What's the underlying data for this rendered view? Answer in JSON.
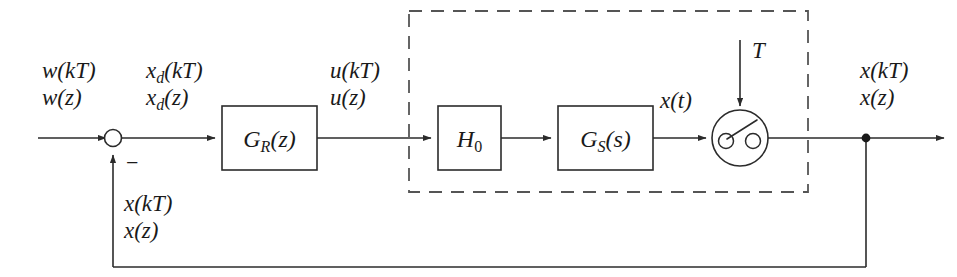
{
  "diagram": {
    "signals": {
      "reference_discrete": "w(kT)",
      "reference_ztransform": "w(z)",
      "error_discrete_base": "x",
      "error_discrete_sub": "d",
      "error_discrete_rest": "(kT)",
      "error_z_base": "x",
      "error_z_sub": "d",
      "error_z_rest": "(z)",
      "control_discrete": "u(kT)",
      "control_ztransform": "u(z)",
      "plant_output_continuous": "x(t)",
      "output_discrete": "x(kT)",
      "output_ztransform": "x(z)",
      "feedback_discrete": "x(kT)",
      "feedback_ztransform": "x(z)",
      "sampling_period": "T",
      "negative_sign": "−"
    },
    "blocks": [
      {
        "id": "controller",
        "base": "G",
        "sub": "R",
        "arg": "(z)",
        "label": "G_R(z)"
      },
      {
        "id": "hold",
        "base": "H",
        "sub": "0",
        "arg": "",
        "label": "H_0"
      },
      {
        "id": "plant",
        "base": "G",
        "sub": "S",
        "arg": "(s)",
        "label": "G_S(s)"
      }
    ],
    "elements": {
      "summing_junction": "summing-junction",
      "sampler": "sampler-switch",
      "feedback_tap": "feedback-tap-node",
      "dashed_region": "continuous-time-region"
    },
    "colors": {
      "line": "#2b2b2b",
      "dashed": "#555555",
      "text": "#1a1a1a",
      "background": "#ffffff"
    }
  }
}
